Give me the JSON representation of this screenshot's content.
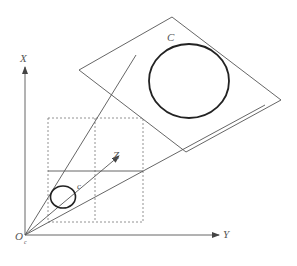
{
  "diagram": {
    "type": "camera-projection-geometry",
    "labels": {
      "x_axis": "X",
      "y_axis": "Y",
      "z_axis": "Z",
      "origin": "O",
      "origin_subscript": "c",
      "world_ellipse": "C",
      "image_ellipse": "c"
    },
    "colors": {
      "line": "#555555",
      "ellipse": "#222222",
      "dashed": "#777777",
      "background": "#ffffff"
    }
  }
}
